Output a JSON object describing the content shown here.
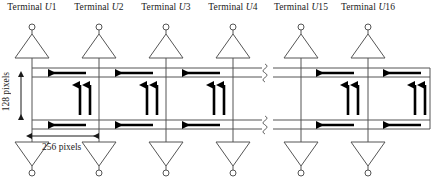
{
  "diagram": {
    "colors": {
      "line": "#555555",
      "arrow": "#000000",
      "text": "#1a1a1a",
      "background": "#ffffff"
    },
    "terminals": [
      {
        "prefix": "Terminal ",
        "symbol": "U",
        "index": "1",
        "x": 32
      },
      {
        "prefix": "Terminal ",
        "symbol": "U",
        "index": "2",
        "x": 99
      },
      {
        "prefix": "Terminal ",
        "symbol": "U",
        "index": "3",
        "x": 166
      },
      {
        "prefix": "Terminal ",
        "symbol": "U",
        "index": "4",
        "x": 233
      },
      {
        "prefix": "Terminal ",
        "symbol": "U",
        "index": "15",
        "x": 301
      },
      {
        "prefix": "Terminal ",
        "symbol": "U",
        "index": "16",
        "x": 368
      }
    ],
    "dimensions": {
      "vertical": {
        "label": "128 pixels",
        "value": 128,
        "unit": "pixels"
      },
      "horizontal": {
        "label": "256 pixels",
        "value": 256,
        "unit": "pixels"
      }
    },
    "geometry": {
      "columns_x": [
        32,
        99,
        166,
        233,
        301,
        368
      ],
      "bus_lines_y": [
        68,
        77,
        120,
        129
      ],
      "top_triangle_apex_y": 34,
      "top_triangle_base_y": 58,
      "bottom_triangle_base_y": 142,
      "bottom_triangle_apex_y": 166,
      "node_circle_top_y": 27,
      "node_circle_bottom_y": 173,
      "triangle_half_width": 17,
      "node_radius": 3,
      "break_x": 267,
      "bus_left_x": 32,
      "bus_right_x": 430
    },
    "horizontal_arrows": {
      "direction": "left",
      "count_per_bus": 5,
      "centers_x": [
        66,
        133,
        200,
        334,
        400
      ],
      "length": 40,
      "bus_rows_y": [
        73,
        125
      ]
    },
    "vertical_arrow_pairs": {
      "count": 5,
      "centers_x": [
        84,
        151,
        218,
        352,
        419
      ],
      "top_y": 83,
      "bottom_y": 115,
      "pair_gap": 9,
      "up_label": "arrow-up",
      "down_label": "arrow-down"
    },
    "break_symbols": {
      "glyph": "zigzag-break",
      "x": 267,
      "rows_y": [
        68,
        77,
        120,
        129
      ]
    }
  }
}
